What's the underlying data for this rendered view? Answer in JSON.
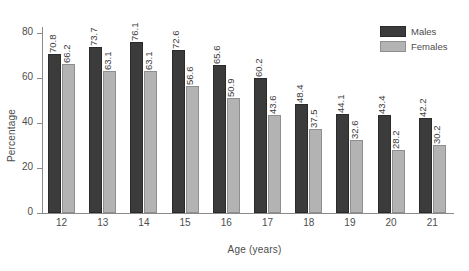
{
  "chart_data": {
    "type": "bar",
    "title": "",
    "xlabel": "Age (years)",
    "ylabel": "Percentage",
    "categories": [
      "12",
      "13",
      "14",
      "15",
      "16",
      "17",
      "18",
      "19",
      "20",
      "21"
    ],
    "series": [
      {
        "name": "Males",
        "color": "#3b3b3b",
        "values": [
          70.8,
          73.7,
          76.1,
          72.6,
          65.6,
          60.2,
          48.4,
          44.1,
          43.4,
          42.2
        ],
        "labels": [
          "70.8",
          "73.7",
          "76.1",
          "72.6",
          "65.6",
          "60.2",
          "48.4",
          "44.1",
          "43.4",
          "42.2"
        ]
      },
      {
        "name": "Females",
        "color": "#b3b3b3",
        "values": [
          66.2,
          63.1,
          63.1,
          56.6,
          50.9,
          43.6,
          37.5,
          32.6,
          28.2,
          30.2
        ],
        "labels": [
          "66.2",
          "63.1",
          "63.1",
          "56.6",
          "50.9",
          "43.6",
          "37.5",
          "32.6",
          "28.2",
          "30.2"
        ]
      }
    ],
    "ylim": [
      0,
      80
    ],
    "yticks": [
      0,
      20,
      40,
      60,
      80
    ],
    "ytick_labels": [
      "0",
      "20",
      "40",
      "60",
      "80"
    ],
    "grid": false,
    "legend_position": "top-right"
  },
  "legend": {
    "items": [
      {
        "label": "Males"
      },
      {
        "label": "Females"
      }
    ]
  }
}
